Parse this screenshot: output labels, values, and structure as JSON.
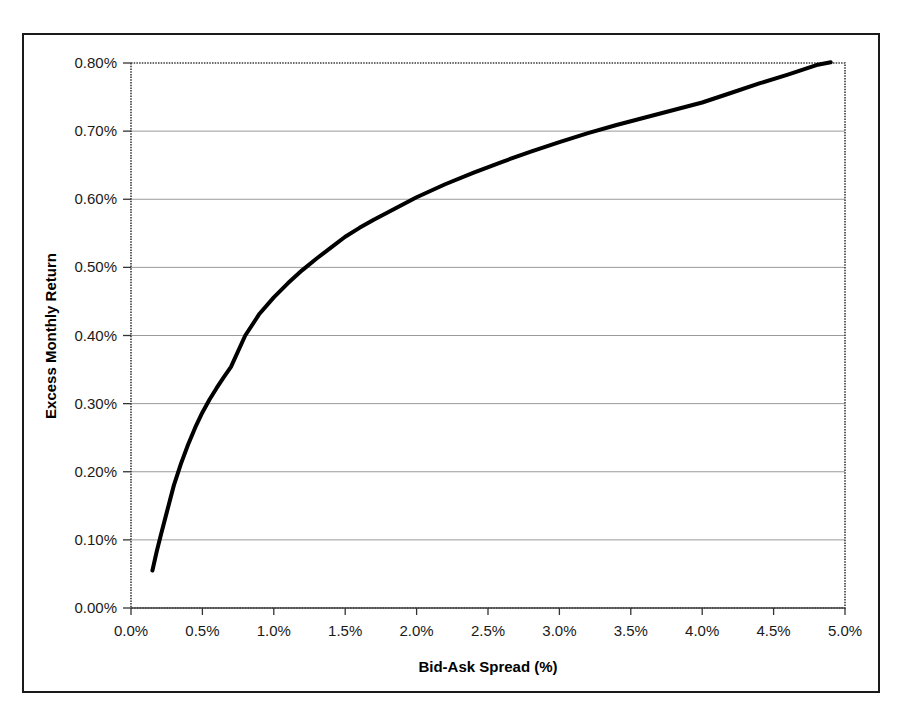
{
  "chart_data": {
    "type": "line",
    "title": "",
    "xlabel": "Bid-Ask Spread (%)",
    "ylabel": "Excess Monthly Return",
    "xlim": [
      0.0,
      5.0
    ],
    "ylim": [
      0.0,
      0.8
    ],
    "grid": "horizontal",
    "legend": "none",
    "line_color": "#000000",
    "line_width_px": 4,
    "xticks": [
      "0.0%",
      "0.5%",
      "1.0%",
      "1.5%",
      "2.0%",
      "2.5%",
      "3.0%",
      "3.5%",
      "4.0%",
      "4.5%",
      "5.0%"
    ],
    "xtick_values": [
      0.0,
      0.5,
      1.0,
      1.5,
      2.0,
      2.5,
      3.0,
      3.5,
      4.0,
      4.5,
      5.0
    ],
    "yticks": [
      "0.00%",
      "0.10%",
      "0.20%",
      "0.30%",
      "0.40%",
      "0.50%",
      "0.60%",
      "0.70%",
      "0.80%"
    ],
    "ytick_values": [
      0.0,
      0.1,
      0.2,
      0.3,
      0.4,
      0.5,
      0.6,
      0.7,
      0.8
    ],
    "series": [
      {
        "name": "Excess Monthly Return vs Bid-Ask Spread",
        "x": [
          0.15,
          0.18,
          0.21,
          0.25,
          0.3,
          0.35,
          0.4,
          0.45,
          0.5,
          0.55,
          0.6,
          0.65,
          0.7,
          0.8,
          0.9,
          1.0,
          1.1,
          1.2,
          1.3,
          1.4,
          1.5,
          1.6,
          1.7,
          1.8,
          1.9,
          2.0,
          2.2,
          2.4,
          2.6,
          2.8,
          3.0,
          3.2,
          3.4,
          3.6,
          3.8,
          4.0,
          4.2,
          4.4,
          4.6,
          4.8,
          4.9
        ],
        "y": [
          0.055,
          0.083,
          0.108,
          0.14,
          0.18,
          0.212,
          0.24,
          0.265,
          0.287,
          0.306,
          0.323,
          0.339,
          0.354,
          0.4,
          0.432,
          0.456,
          0.477,
          0.496,
          0.513,
          0.529,
          0.545,
          0.558,
          0.57,
          0.581,
          0.592,
          0.603,
          0.622,
          0.639,
          0.655,
          0.67,
          0.684,
          0.697,
          0.709,
          0.72,
          0.731,
          0.742,
          0.756,
          0.77,
          0.783,
          0.797,
          0.801
        ]
      }
    ]
  },
  "axes": {
    "x_title": "Bid-Ask Spread (%)",
    "y_title": "Excess Monthly Return"
  }
}
